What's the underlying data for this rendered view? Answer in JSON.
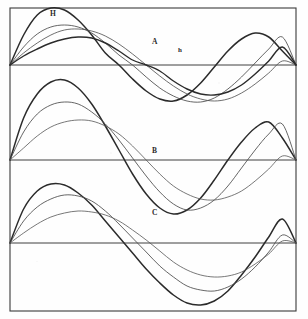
{
  "figure": {
    "panel_labels": [
      "A",
      "B",
      "C"
    ],
    "amplitude_labels": {
      "major": "H",
      "minor": "h"
    },
    "background_color": "#fefefe",
    "ink_color": "#2b2b2b",
    "frame": {
      "x": 10,
      "y": 8,
      "width": 286,
      "height": 303,
      "stroke": "#3a3a3a",
      "stroke_width": 1.1
    }
  },
  "labels": {
    "H": {
      "text": "H",
      "x": 50,
      "y": 10
    },
    "h": {
      "text": "h",
      "x": 178,
      "y": 47
    },
    "A": {
      "text": "A",
      "x": 152,
      "y": 38
    },
    "B": {
      "text": "B",
      "x": 152,
      "y": 147
    },
    "C": {
      "text": "C",
      "x": 152,
      "y": 209
    }
  },
  "chart_data": {
    "type": "line",
    "xlabel": "",
    "ylabel": "",
    "grid": false,
    "legend_position": "none",
    "x_range": [
      0,
      1
    ],
    "node_points": [
      0.0,
      0.5,
      1.0
    ],
    "axes": [
      {
        "panel": "A",
        "baseline_y": 65,
        "x_start": 10,
        "x_end": 296,
        "amplitude_up": 57,
        "amplitude_down": 57
      },
      {
        "panel": "B",
        "baseline_y": 160,
        "x_start": 10,
        "x_end": 296,
        "amplitude_up": 80,
        "amplitude_down": 40
      },
      {
        "panel": "C",
        "baseline_y": 243,
        "x_start": 10,
        "x_end": 296,
        "amplitude_up": 60,
        "amplitude_down": 68
      }
    ],
    "panels": [
      {
        "label": "A",
        "baseline_y": 65,
        "series": [
          {
            "name": "A-curve-1-major-H",
            "amplitude": 57,
            "peak_x": 0.18,
            "weight": 1.5,
            "tone": "#2b2b2b",
            "points_y": [
              0,
              -30,
              -50,
              -57,
              -55,
              -45,
              -30,
              -12,
              0,
              14,
              26,
              34,
              36,
              30,
              18,
              2,
              -14,
              -26,
              -32,
              -28,
              -14,
              0
            ]
          },
          {
            "name": "A-curve-2-mid",
            "amplitude": 40,
            "peak_x": 0.26,
            "weight": 0.85,
            "tone": "#4a4a4a",
            "points_y": [
              0,
              -18,
              -31,
              -38,
              -40,
              -38,
              -32,
              -22,
              -10,
              0,
              12,
              23,
              31,
              36,
              37,
              33,
              24,
              12,
              -2,
              -16,
              -28,
              0
            ]
          },
          {
            "name": "A-curve-3-slow",
            "amplitude": 36,
            "peak_x": 0.34,
            "weight": 0.8,
            "tone": "#4a4a4a",
            "points_y": [
              0,
              -12,
              -22,
              -30,
              -35,
              -36,
              -34,
              -29,
              -21,
              -11,
              0,
              11,
              21,
              29,
              34,
              36,
              34,
              28,
              19,
              8,
              -4,
              0
            ]
          },
          {
            "name": "A-curve-4-minor-h",
            "amplitude": 30,
            "peak_x": 0.64,
            "weight": 1.4,
            "tone": "#2b2b2b",
            "points_y": [
              0,
              -9,
              -16,
              -22,
              -26,
              -28,
              -27,
              -22,
              -14,
              -5,
              0,
              6,
              16,
              24,
              29,
              30,
              27,
              20,
              9,
              -4,
              -18,
              0
            ]
          }
        ]
      },
      {
        "label": "B",
        "baseline_y": 160,
        "series": [
          {
            "name": "B-curve-1-major",
            "amplitude": 80,
            "peak_x": 0.22,
            "weight": 1.5,
            "tone": "#2b2b2b",
            "points_y": [
              0,
              -42,
              -66,
              -78,
              -80,
              -72,
              -56,
              -34,
              -10,
              14,
              34,
              48,
              54,
              50,
              38,
              20,
              0,
              -18,
              -32,
              -38,
              -22,
              0
            ]
          },
          {
            "name": "B-curve-2-mid",
            "amplitude": 58,
            "peak_x": 0.28,
            "weight": 0.85,
            "tone": "#4a4a4a",
            "points_y": [
              0,
              -28,
              -46,
              -55,
              -58,
              -56,
              -48,
              -36,
              -20,
              -2,
              16,
              32,
              44,
              50,
              48,
              40,
              26,
              8,
              -10,
              -26,
              -36,
              0
            ]
          },
          {
            "name": "B-curve-3-slow",
            "amplitude": 40,
            "peak_x": 0.36,
            "weight": 0.8,
            "tone": "#555555",
            "points_y": [
              0,
              -12,
              -24,
              -33,
              -38,
              -40,
              -39,
              -34,
              -26,
              -14,
              0,
              14,
              26,
              34,
              39,
              40,
              37,
              31,
              21,
              9,
              -4,
              0
            ]
          }
        ]
      },
      {
        "label": "C",
        "baseline_y": 243,
        "series": [
          {
            "name": "C-curve-1-major",
            "amplitude": 60,
            "peak_x": 0.2,
            "weight": 1.5,
            "tone": "#2b2b2b",
            "points_y": [
              0,
              -34,
              -52,
              -59,
              -58,
              -50,
              -38,
              -22,
              -6,
              10,
              26,
              40,
              52,
              60,
              62,
              58,
              48,
              32,
              14,
              -6,
              -24,
              0
            ]
          },
          {
            "name": "C-curve-2-mid",
            "amplitude": 48,
            "peak_x": 0.3,
            "weight": 0.85,
            "tone": "#4a4a4a",
            "points_y": [
              0,
              -22,
              -36,
              -44,
              -48,
              -47,
              -42,
              -32,
              -19,
              -5,
              9,
              23,
              34,
              43,
              47,
              48,
              44,
              36,
              24,
              9,
              -8,
              0
            ]
          },
          {
            "name": "C-curve-3-slow",
            "amplitude": 32,
            "peak_x": 0.4,
            "weight": 0.8,
            "tone": "#555555",
            "points_y": [
              0,
              -10,
              -19,
              -26,
              -30,
              -32,
              -31,
              -28,
              -22,
              -13,
              -3,
              8,
              19,
              27,
              32,
              34,
              33,
              29,
              21,
              11,
              -2,
              0
            ]
          }
        ]
      }
    ]
  }
}
